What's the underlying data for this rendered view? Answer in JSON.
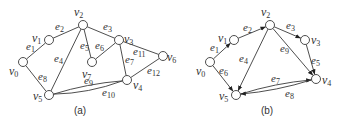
{
  "figure": {
    "graph_a": {
      "caption": "(a)",
      "directed": false,
      "vertices": [
        {
          "id": "v0",
          "base": "v",
          "sub": "0",
          "x": 23,
          "y": 62,
          "lx": 9,
          "ly": 75
        },
        {
          "id": "v1",
          "base": "v",
          "sub": "1",
          "x": 49,
          "y": 40,
          "lx": 32,
          "ly": 42
        },
        {
          "id": "v2",
          "base": "v",
          "sub": "2",
          "x": 83,
          "y": 25,
          "lx": 74,
          "ly": 16
        },
        {
          "id": "v3",
          "base": "v",
          "sub": "3",
          "x": 119,
          "y": 40,
          "lx": 124,
          "ly": 43
        },
        {
          "id": "v4",
          "base": "v",
          "sub": "4",
          "x": 127,
          "y": 80,
          "lx": 133,
          "ly": 89
        },
        {
          "id": "v5",
          "base": "v",
          "sub": "5",
          "x": 49,
          "y": 95,
          "lx": 33,
          "ly": 100
        },
        {
          "id": "v6",
          "base": "v",
          "sub": "6",
          "x": 163,
          "y": 56,
          "lx": 167,
          "ly": 61
        },
        {
          "id": "v7",
          "base": "v",
          "sub": "7",
          "x": 92,
          "y": 62,
          "lx": 82,
          "ly": 78
        }
      ],
      "edges": [
        {
          "id": "e1",
          "base": "e",
          "sub": "1",
          "from": "v0",
          "to": "v1",
          "lx": 26,
          "ly": 50
        },
        {
          "id": "e2",
          "base": "e",
          "sub": "2",
          "from": "v1",
          "to": "v2",
          "lx": 55,
          "ly": 30
        },
        {
          "id": "e3",
          "base": "e",
          "sub": "3",
          "from": "v2",
          "to": "v3",
          "lx": 103,
          "ly": 30
        },
        {
          "id": "e4",
          "base": "e",
          "sub": "4",
          "from": "v2",
          "to": "v5",
          "lx": 54,
          "ly": 62
        },
        {
          "id": "e5",
          "base": "e",
          "sub": "5",
          "from": "v2",
          "to": "v7",
          "lx": 80,
          "ly": 49
        },
        {
          "id": "e6",
          "base": "e",
          "sub": "6",
          "from": "v7",
          "to": "v3",
          "lx": 95,
          "ly": 49
        },
        {
          "id": "e7",
          "base": "e",
          "sub": "7",
          "from": "v3",
          "to": "v4",
          "lx": 125,
          "ly": 63
        },
        {
          "id": "e8",
          "base": "e",
          "sub": "8",
          "from": "v0",
          "to": "v5",
          "lx": 38,
          "ly": 80
        },
        {
          "id": "e9",
          "base": "e",
          "sub": "9",
          "from": "v5",
          "to": "v4",
          "curve": -4,
          "lx": 84,
          "ly": 84
        },
        {
          "id": "e10",
          "base": "e",
          "sub": "10",
          "from": "v5",
          "to": "v4",
          "curve": 6,
          "lx": 102,
          "ly": 96
        },
        {
          "id": "e11",
          "base": "e",
          "sub": "11",
          "from": "v3",
          "to": "v6",
          "lx": 133,
          "ly": 55
        },
        {
          "id": "e12",
          "base": "e",
          "sub": "12",
          "from": "v4",
          "to": "v6",
          "lx": 147,
          "ly": 74
        }
      ]
    },
    "graph_b": {
      "caption": "(b)",
      "directed": true,
      "vertices": [
        {
          "id": "v0",
          "base": "v",
          "sub": "0",
          "x": 210,
          "y": 62,
          "lx": 196,
          "ly": 75
        },
        {
          "id": "v1",
          "base": "v",
          "sub": "1",
          "x": 234,
          "y": 40,
          "lx": 218,
          "ly": 42
        },
        {
          "id": "v2",
          "base": "v",
          "sub": "2",
          "x": 270,
          "y": 25,
          "lx": 261,
          "ly": 16
        },
        {
          "id": "v3",
          "base": "v",
          "sub": "3",
          "x": 305,
          "y": 40,
          "lx": 311,
          "ly": 44
        },
        {
          "id": "v4",
          "base": "v",
          "sub": "4",
          "x": 316,
          "y": 79,
          "lx": 322,
          "ly": 84
        },
        {
          "id": "v5",
          "base": "v",
          "sub": "5",
          "x": 236,
          "y": 95,
          "lx": 219,
          "ly": 100
        }
      ],
      "edges": [
        {
          "id": "e1",
          "base": "e",
          "sub": "1",
          "from": "v0",
          "to": "v1",
          "lx": 210,
          "ly": 51
        },
        {
          "id": "e2",
          "base": "e",
          "sub": "2",
          "from": "v1",
          "to": "v2",
          "lx": 243,
          "ly": 31
        },
        {
          "id": "e3",
          "base": "e",
          "sub": "3",
          "from": "v2",
          "to": "v3",
          "lx": 286,
          "ly": 29
        },
        {
          "id": "e4",
          "base": "e",
          "sub": "4",
          "from": "v2",
          "to": "v5",
          "lx": 239,
          "ly": 62
        },
        {
          "id": "e5",
          "base": "e",
          "sub": "5",
          "from": "v3",
          "to": "v4",
          "lx": 311,
          "ly": 64
        },
        {
          "id": "e6",
          "base": "e",
          "sub": "6",
          "from": "v0",
          "to": "v5",
          "lx": 219,
          "ly": 74
        },
        {
          "id": "e7",
          "base": "e",
          "sub": "7",
          "from": "v5",
          "to": "v4",
          "curve": -4,
          "lx": 271,
          "ly": 82
        },
        {
          "id": "e8",
          "base": "e",
          "sub": "8",
          "from": "v4",
          "to": "v5",
          "curve": -4,
          "lx": 285,
          "ly": 97
        },
        {
          "id": "e9",
          "base": "e",
          "sub": "9",
          "from": "v2",
          "to": "v4",
          "lx": 280,
          "ly": 52
        }
      ]
    }
  }
}
